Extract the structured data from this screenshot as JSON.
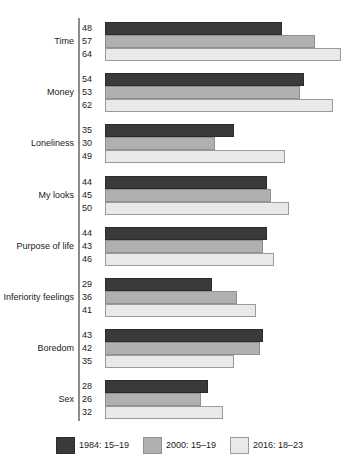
{
  "chart_data": {
    "type": "bar",
    "orientation": "horizontal",
    "title": "",
    "subtitle": "",
    "xlabel": "",
    "ylabel": "",
    "xlim": [
      0,
      70
    ],
    "grid": false,
    "legend_position": "bottom",
    "data_labels": true,
    "categories": [
      "Time",
      "Money",
      "Loneliness",
      "My looks",
      "Purpose of life",
      "Inferiority feelings",
      "Boredom",
      "Sex"
    ],
    "series": [
      {
        "name": "1984: 15–19",
        "color": "#3a3a3a",
        "values": [
          48,
          54,
          35,
          44,
          44,
          29,
          43,
          28
        ]
      },
      {
        "name": "2000: 15–19",
        "color": "#b0b0b0",
        "values": [
          57,
          53,
          30,
          45,
          43,
          36,
          42,
          26
        ]
      },
      {
        "name": "2016: 18–23",
        "color": "#e9e9e9",
        "values": [
          64,
          62,
          49,
          50,
          46,
          41,
          35,
          32
        ]
      }
    ]
  },
  "legend": {
    "items": [
      {
        "label": "1984: 15–19",
        "color": "#3a3a3a"
      },
      {
        "label": "2000: 15–19",
        "color": "#b0b0b0"
      },
      {
        "label": "2016: 18–23",
        "color": "#e9e9e9"
      }
    ]
  },
  "axis": {
    "spine_color": "#8c8c8c"
  }
}
